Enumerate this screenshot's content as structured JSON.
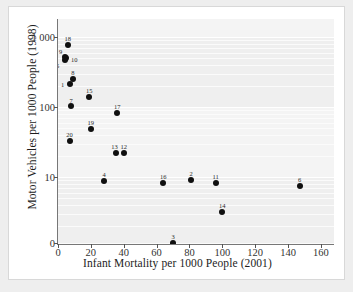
{
  "chart_data": {
    "type": "scatter",
    "title": "",
    "xlabel": "Infant Mortality per 1000 People (2001)",
    "ylabel": "Motor Vehicles per 1000 People (1998)",
    "xlim": [
      0,
      168
    ],
    "ylim_note": "logarithmic axis, labeled ticks 1 000 / 100 / 10 / 0",
    "yscale": "log",
    "grid": true,
    "legend": "none",
    "xticks": [
      {
        "value": 0,
        "label": "0"
      },
      {
        "value": 20,
        "label": "20"
      },
      {
        "value": 40,
        "label": "40"
      },
      {
        "value": 60,
        "label": "60"
      },
      {
        "value": 80,
        "label": "80"
      },
      {
        "value": 100,
        "label": "100"
      },
      {
        "value": 120,
        "label": "120"
      },
      {
        "value": 140,
        "label": "140"
      },
      {
        "value": 160,
        "label": "160"
      }
    ],
    "yticks": [
      {
        "value": 1000,
        "label": "1 000"
      },
      {
        "value": 100,
        "label": "100"
      },
      {
        "value": 10,
        "label": "10"
      },
      {
        "value": 0,
        "label": "0"
      }
    ],
    "points": [
      {
        "label": "18",
        "x": 6,
        "y": 780
      },
      {
        "label": "9",
        "x": 4,
        "y": 520
      },
      {
        "label": "10",
        "x": 5,
        "y": 500
      },
      {
        "label": "5",
        "x": 4,
        "y": 470
      },
      {
        "label": "8",
        "x": 9,
        "y": 250
      },
      {
        "label": "1",
        "x": 7,
        "y": 210
      },
      {
        "label": "7",
        "x": 8,
        "y": 105
      },
      {
        "label": "15",
        "x": 19,
        "y": 140
      },
      {
        "label": "17",
        "x": 36,
        "y": 83
      },
      {
        "label": "19",
        "x": 20,
        "y": 48
      },
      {
        "label": "20",
        "x": 7,
        "y": 33
      },
      {
        "label": "13",
        "x": 35,
        "y": 22
      },
      {
        "label": "12",
        "x": 40,
        "y": 22
      },
      {
        "label": "4",
        "x": 28,
        "y": 8.8
      },
      {
        "label": "16",
        "x": 64,
        "y": 8.2
      },
      {
        "label": "2",
        "x": 81,
        "y": 9.0
      },
      {
        "label": "11",
        "x": 96,
        "y": 8.2
      },
      {
        "label": "6",
        "x": 147,
        "y": 7.4
      },
      {
        "label": "14",
        "x": 100,
        "y": 3.2
      },
      {
        "label": "3",
        "x": 70,
        "y": 0.2
      }
    ]
  },
  "colors": {
    "page_background": "#eeeeee",
    "card_background": "#ffffff",
    "plot_background": "#f4f4f4",
    "point_color": "#101010",
    "grid_color": "#ffffff",
    "text_color": "#1d1d1d"
  }
}
